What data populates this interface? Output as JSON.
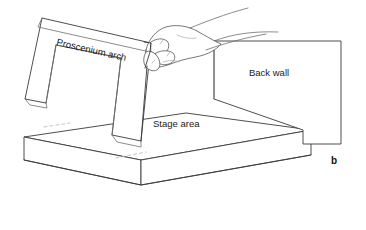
{
  "figure": {
    "kind": "line-art-diagram",
    "background_color": "#ffffff",
    "line_color": "#3a3a3a",
    "text_color": "#1a1a1a"
  },
  "labels": {
    "proscenium_arch": "Proscenium arch",
    "stage_area": "Stage area",
    "back_wall": "Back wall",
    "figure_letter": "b"
  },
  "parts": {
    "arch": {
      "name": "proscenium-arch",
      "description": "inverted-U panel held above the stage"
    },
    "stage": {
      "name": "stage-area",
      "description": "rectangular slab platform in isometric view"
    },
    "wall": {
      "name": "back-wall",
      "description": "upright rectangular panel at rear right"
    },
    "hand": {
      "name": "hand",
      "description": "hand gripping the top edge of the proscenium arch"
    }
  }
}
